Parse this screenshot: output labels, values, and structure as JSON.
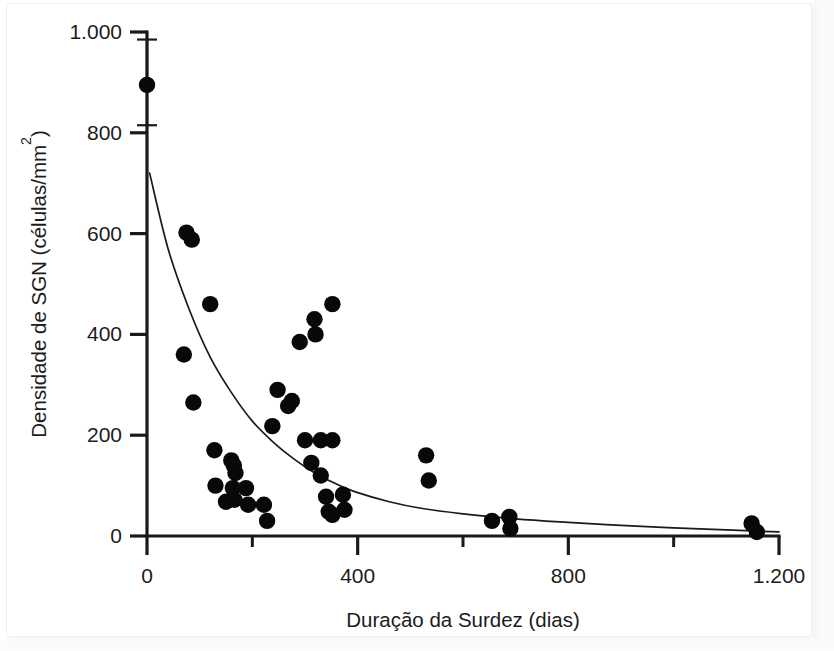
{
  "chart_data": {
    "type": "scatter",
    "title": "",
    "xlabel": "Duração da Surdez (dias)",
    "ylabel": "Densidade de SGN (células/mm²)",
    "ylabel_main": "Densidade de SGN (células/mm",
    "ylabel_sup": "2",
    "ylabel_tail": ")",
    "xlim": [
      0,
      1200
    ],
    "ylim": [
      0,
      1000
    ],
    "grid": false,
    "legend": null,
    "x_ticks_major": [
      0,
      400,
      800,
      1200
    ],
    "x_ticks_major_labels": [
      "0",
      "400",
      "800",
      "1.200"
    ],
    "x_ticks_minor": [
      200,
      600,
      1000
    ],
    "y_ticks_major": [
      0,
      200,
      400,
      600,
      800,
      1000
    ],
    "y_ticks_major_labels": [
      "0",
      "200",
      "400",
      "600",
      "800",
      "1.000"
    ],
    "points": [
      {
        "x": 0,
        "y": 895
      },
      {
        "x": 75,
        "y": 602
      },
      {
        "x": 85,
        "y": 588
      },
      {
        "x": 70,
        "y": 360
      },
      {
        "x": 120,
        "y": 460
      },
      {
        "x": 88,
        "y": 265
      },
      {
        "x": 128,
        "y": 170
      },
      {
        "x": 130,
        "y": 100
      },
      {
        "x": 160,
        "y": 150
      },
      {
        "x": 165,
        "y": 140
      },
      {
        "x": 168,
        "y": 125
      },
      {
        "x": 163,
        "y": 95
      },
      {
        "x": 166,
        "y": 72
      },
      {
        "x": 150,
        "y": 68
      },
      {
        "x": 188,
        "y": 95
      },
      {
        "x": 192,
        "y": 62
      },
      {
        "x": 222,
        "y": 62
      },
      {
        "x": 228,
        "y": 30
      },
      {
        "x": 238,
        "y": 218
      },
      {
        "x": 248,
        "y": 290
      },
      {
        "x": 268,
        "y": 258
      },
      {
        "x": 275,
        "y": 268
      },
      {
        "x": 290,
        "y": 385
      },
      {
        "x": 300,
        "y": 190
      },
      {
        "x": 312,
        "y": 145
      },
      {
        "x": 318,
        "y": 430
      },
      {
        "x": 320,
        "y": 400
      },
      {
        "x": 330,
        "y": 190
      },
      {
        "x": 352,
        "y": 190
      },
      {
        "x": 352,
        "y": 460
      },
      {
        "x": 330,
        "y": 120
      },
      {
        "x": 340,
        "y": 78
      },
      {
        "x": 345,
        "y": 48
      },
      {
        "x": 352,
        "y": 42
      },
      {
        "x": 372,
        "y": 82
      },
      {
        "x": 375,
        "y": 52
      },
      {
        "x": 530,
        "y": 160
      },
      {
        "x": 535,
        "y": 110
      },
      {
        "x": 655,
        "y": 30
      },
      {
        "x": 688,
        "y": 38
      },
      {
        "x": 690,
        "y": 15
      },
      {
        "x": 1148,
        "y": 25
      },
      {
        "x": 1158,
        "y": 8
      }
    ],
    "errorbar": {
      "x": 0,
      "y": 895,
      "y_low": 815,
      "y_high": 985
    },
    "fit_curve": {
      "description": "decaimento exponencial ajustado",
      "x_start": 5,
      "y_start": 720,
      "x_end": 1200,
      "y_end": 8,
      "samples": [
        {
          "x": 5,
          "y": 720
        },
        {
          "x": 40,
          "y": 570
        },
        {
          "x": 80,
          "y": 450
        },
        {
          "x": 120,
          "y": 355
        },
        {
          "x": 160,
          "y": 285
        },
        {
          "x": 200,
          "y": 228
        },
        {
          "x": 240,
          "y": 186
        },
        {
          "x": 280,
          "y": 152
        },
        {
          "x": 320,
          "y": 124
        },
        {
          "x": 360,
          "y": 103
        },
        {
          "x": 400,
          "y": 86
        },
        {
          "x": 460,
          "y": 68
        },
        {
          "x": 520,
          "y": 55
        },
        {
          "x": 600,
          "y": 44
        },
        {
          "x": 700,
          "y": 34
        },
        {
          "x": 800,
          "y": 27
        },
        {
          "x": 900,
          "y": 21
        },
        {
          "x": 1000,
          "y": 16
        },
        {
          "x": 1100,
          "y": 12
        },
        {
          "x": 1200,
          "y": 8
        }
      ]
    },
    "colors": {
      "point": "#080808",
      "axis": "#1a1a1a",
      "curve": "#1a1a1a",
      "background": "#ffffff"
    }
  }
}
